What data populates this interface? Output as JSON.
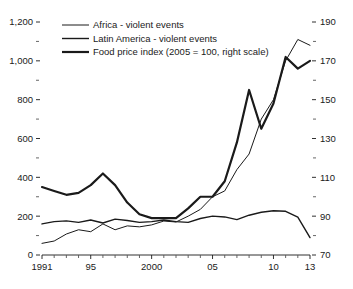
{
  "chart_data": {
    "type": "line",
    "title": "",
    "subtitle": "",
    "xlabel": "",
    "ylabel": "",
    "ylabel_right": "",
    "grid": false,
    "legend_position": "top-center",
    "x": [
      1991,
      1992,
      1993,
      1994,
      1995,
      1996,
      1997,
      1998,
      1999,
      2000,
      2001,
      2002,
      2003,
      2004,
      2005,
      2006,
      2007,
      2008,
      2009,
      2010,
      2011,
      2012,
      2013
    ],
    "xlim": [
      1991,
      2013
    ],
    "xticks": [
      1991,
      1995,
      2000,
      2005,
      2010,
      2013
    ],
    "xticklabels": [
      "1991",
      "95",
      "2000",
      "05",
      "10",
      "13"
    ],
    "xminor_ticks": [
      1992,
      1993,
      1994,
      1996,
      1997,
      1998,
      1999,
      2001,
      2002,
      2003,
      2004,
      2006,
      2007,
      2008,
      2009,
      2011,
      2012
    ],
    "ylim": [
      0,
      1200
    ],
    "yticks": [
      0,
      200,
      400,
      600,
      800,
      1000,
      1200
    ],
    "yticklabels": [
      "0",
      "200",
      "400",
      "600",
      "800",
      "1,000",
      "1,200"
    ],
    "yminor_ticks": [
      100,
      300,
      500,
      700,
      900,
      1100
    ],
    "ylim_right": [
      70,
      190
    ],
    "yticks_right": [
      70,
      90,
      110,
      130,
      150,
      170,
      190
    ],
    "yticklabels_right": [
      "70",
      "90",
      "110",
      "130",
      "150",
      "170",
      "190"
    ],
    "yminor_ticks_right": [
      80,
      100,
      120,
      140,
      160,
      180
    ],
    "series": [
      {
        "name": "Africa - violent events",
        "axis": "left",
        "stroke_width": 1.0,
        "color": "#1a1a1a",
        "values": [
          60,
          72,
          108,
          130,
          120,
          160,
          130,
          150,
          145,
          155,
          175,
          170,
          200,
          235,
          300,
          330,
          440,
          520,
          700,
          800,
          1000,
          1110,
          1080
        ]
      },
      {
        "name": "Latin America - violent events",
        "axis": "left",
        "stroke_width": 1.4,
        "color": "#1a1a1a",
        "values": [
          160,
          172,
          176,
          168,
          180,
          165,
          185,
          178,
          168,
          172,
          180,
          172,
          168,
          188,
          200,
          196,
          182,
          205,
          220,
          228,
          225,
          195,
          90
        ]
      },
      {
        "name": "Food price index (2005 = 100, right scale)",
        "axis": "right",
        "stroke_width": 2.2,
        "color": "#1a1a1a",
        "values": [
          105,
          103,
          101,
          102,
          106,
          112,
          106,
          97,
          91,
          89,
          89,
          89,
          94,
          100,
          100,
          108,
          128,
          155,
          135,
          148,
          172,
          166,
          170
        ]
      }
    ],
    "legend": [
      "Africa - violent events",
      "Latin America - violent events",
      "Food price index (2005 = 100, right scale)"
    ]
  },
  "colors": {
    "background": "#ffffff",
    "ink": "#1a1a1a",
    "minor_tick": "#555555"
  }
}
